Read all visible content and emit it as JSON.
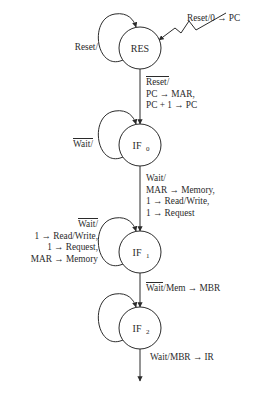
{
  "diagram": {
    "type": "state-transition-diagram",
    "background_color": "#ffffff",
    "stroke_color": "#2b2b2b",
    "states": [
      {
        "id": "RES",
        "label": "RES",
        "subscript": "",
        "cx": 140,
        "cy": 48,
        "r": 21
      },
      {
        "id": "IF0",
        "label": "IF",
        "subscript": "0",
        "cx": 140,
        "cy": 145,
        "r": 21
      },
      {
        "id": "IF1",
        "label": "IF",
        "subscript": "1",
        "cx": 140,
        "cy": 252,
        "r": 21
      },
      {
        "id": "IF2",
        "label": "IF",
        "subscript": "2",
        "cx": 140,
        "cy": 328,
        "r": 21
      }
    ],
    "entry_edge": {
      "name": "reset-entry",
      "label_lines": [
        {
          "text": "Reset/0 → PC",
          "overbar": false
        }
      ],
      "label_x": 187,
      "label_y": 13
    },
    "self_loops": [
      {
        "state": "RES",
        "name": "res-self-loop",
        "label_lines": [
          {
            "text": "Reset/",
            "overbar": false
          }
        ],
        "label_x": 50,
        "label_y": 42,
        "label_width": 48,
        "align": "right"
      },
      {
        "state": "IF0",
        "name": "if0-self-loop",
        "label_lines": [
          {
            "text": "Wait/",
            "overbar": true
          }
        ],
        "label_x": 45,
        "label_y": 138,
        "label_width": 48,
        "align": "right"
      },
      {
        "state": "IF1",
        "name": "if1-self-loop",
        "label_lines": [
          {
            "text": "Wait/",
            "overbar": true
          },
          {
            "text": "1 → Read/Write,",
            "overbar": false
          },
          {
            "text": "1 → Request,",
            "overbar": false
          },
          {
            "text": "MAR → Memory",
            "overbar": false
          }
        ],
        "label_x": 8,
        "label_y": 218,
        "label_width": 90,
        "align": "right"
      },
      {
        "state": "IF2",
        "name": "if2-self-loop",
        "label_lines": [
          {
            "text": "Wait/",
            "overbar": true
          }
        ],
        "label_x": 45,
        "label_y": 321,
        "label_width": 48,
        "align": "right"
      }
    ],
    "transitions": [
      {
        "name": "res-to-if0",
        "from": "RES",
        "to": "IF0",
        "label_lines": [
          {
            "text": "Reset/",
            "overbar": true
          },
          {
            "text": "PC → MAR,",
            "overbar": false
          },
          {
            "text": "PC + 1 → PC",
            "overbar": false
          }
        ],
        "label_x": 146,
        "label_y": 76
      },
      {
        "name": "if0-to-if1",
        "from": "IF0",
        "to": "IF1",
        "label_lines": [
          {
            "text": "Wait/",
            "overbar": false
          },
          {
            "text": "MAR → Memory,",
            "overbar": false
          },
          {
            "text": "1 → Read/Write,",
            "overbar": false
          },
          {
            "text": "1 → Request",
            "overbar": false
          }
        ],
        "label_x": 146,
        "label_y": 173
      },
      {
        "name": "if1-to-if2",
        "from": "IF1",
        "to": "IF2",
        "label_lines": [
          {
            "text": "Wait/Mem → MBR",
            "overbar": true,
            "overbar_chars": 4
          }
        ],
        "label_x": 146,
        "label_y": 282
      },
      {
        "name": "if2-to-exit",
        "from": "IF2",
        "to": "exit",
        "label_lines": [
          {
            "text": "Wait/MBR → IR",
            "overbar": false
          }
        ],
        "label_x": 150,
        "label_y": 352
      }
    ]
  }
}
